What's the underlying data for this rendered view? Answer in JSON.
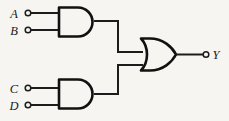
{
  "diagram": {
    "background_color": "#f6f5f2",
    "line_color": "#1c1c1c",
    "inputs": [
      {
        "label": "A",
        "gate": "and-gate-1",
        "pin": 1
      },
      {
        "label": "B",
        "gate": "and-gate-1",
        "pin": 2
      },
      {
        "label": "C",
        "gate": "and-gate-2",
        "pin": 1
      },
      {
        "label": "D",
        "gate": "and-gate-2",
        "pin": 2
      }
    ],
    "outputs": [
      {
        "label": "Y",
        "gate": "or-gate-1"
      }
    ],
    "gates": [
      {
        "id": "and-gate-1",
        "type": "AND",
        "inputs": [
          "A",
          "B"
        ]
      },
      {
        "id": "and-gate-2",
        "type": "AND",
        "inputs": [
          "C",
          "D"
        ]
      },
      {
        "id": "or-gate-1",
        "type": "OR",
        "inputs": [
          "and-gate-1",
          "and-gate-2"
        ],
        "output": "Y"
      }
    ],
    "expression": "Y = (A·B) + (C·D)"
  }
}
